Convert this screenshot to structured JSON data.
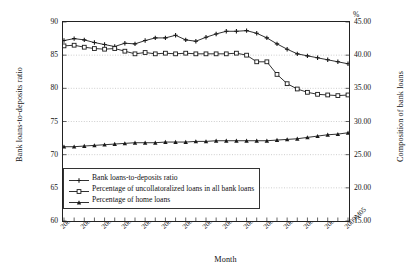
{
  "chart_data": {
    "type": "line",
    "title": "",
    "xlabel": "Month",
    "ylabel": "Bank loans-to-deposits ratio",
    "y2label": "Composition of bank loans",
    "y2unit": "%",
    "ylim": [
      60,
      90
    ],
    "y2lim": [
      15.0,
      45.0
    ],
    "yticks": [
      "60",
      "65",
      "70",
      "75",
      "80",
      "85",
      "90"
    ],
    "y2ticks": [
      "15.00",
      "20.00",
      "25.00",
      "30.00",
      "35.00",
      "40.00",
      "45.00"
    ],
    "grid": true,
    "legend_position": "lower-left-inside",
    "x": [
      "2007M01",
      "2007M02",
      "2007M03",
      "2007M04",
      "2007M05",
      "2007M06",
      "2007M07",
      "2007M08",
      "2007M09",
      "2007M10",
      "2007M11",
      "2007M12",
      "2008M01",
      "2008M02",
      "2008M03",
      "2008M04",
      "2008M05",
      "2008M06",
      "2008M07",
      "2008M08",
      "2008M09",
      "2008M10",
      "2008M11",
      "2008M12",
      "2009M01",
      "2009M02",
      "2009M03",
      "2009M04",
      "2009M05"
    ],
    "xtick_labels": [
      "2007M01",
      "2007M03",
      "2007M05",
      "2007M07",
      "2007M09",
      "2007M11",
      "2008M01",
      "2008M03",
      "2008M05",
      "2008M07",
      "2008M09",
      "2008M11",
      "2009M01",
      "2009M03",
      "2009M05"
    ],
    "series": [
      {
        "name": "Bank loans-to-deposits ratio",
        "axis": "left",
        "marker": "plus",
        "values": [
          87.2,
          87.5,
          87.3,
          86.9,
          86.6,
          86.3,
          86.8,
          86.7,
          87.2,
          87.6,
          87.6,
          88.0,
          87.3,
          87.1,
          87.7,
          88.2,
          88.6,
          88.6,
          88.7,
          88.3,
          87.6,
          86.7,
          85.9,
          85.2,
          84.9,
          84.6,
          84.3,
          84.0,
          83.7
        ]
      },
      {
        "name": "Percentage of uncollatoralized loans in all bank loans",
        "axis": "right",
        "marker": "square",
        "values": [
          41.4,
          41.5,
          41.2,
          41.0,
          40.9,
          41.0,
          40.6,
          40.2,
          40.4,
          40.2,
          40.3,
          40.2,
          40.3,
          40.2,
          40.2,
          40.2,
          40.2,
          40.3,
          40.0,
          39.0,
          39.0,
          37.1,
          35.7,
          34.9,
          34.4,
          34.1,
          34.0,
          33.9,
          34.0
        ]
      },
      {
        "name": "Percentage of home loans",
        "axis": "right",
        "marker": "triangle",
        "values": [
          26.2,
          26.2,
          26.3,
          26.4,
          26.5,
          26.6,
          26.7,
          26.8,
          26.8,
          26.8,
          26.9,
          26.9,
          26.9,
          27.0,
          27.0,
          27.1,
          27.1,
          27.1,
          27.1,
          27.1,
          27.1,
          27.2,
          27.3,
          27.4,
          27.6,
          27.8,
          28.0,
          28.1,
          28.3
        ]
      }
    ]
  },
  "legend": {
    "items": [
      {
        "label": "Bank loans-to-deposits ratio",
        "marker": "plus"
      },
      {
        "label": "Percentage of uncollatoralized loans in all bank loans",
        "marker": "square"
      },
      {
        "label": "Percentage of home loans",
        "marker": "triangle"
      }
    ]
  },
  "colors": {
    "line": "#1a1a1a",
    "grid": "#b9b9b9",
    "axis": "#222222",
    "background": "#ffffff"
  }
}
